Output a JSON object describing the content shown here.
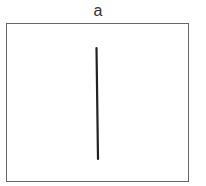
{
  "panel": {
    "label": "a",
    "frame": {
      "x": 6,
      "y": 23,
      "width": 182,
      "height": 158,
      "border_color": "#666666"
    },
    "line": {
      "x1": 96.5,
      "y1": 48,
      "x2": 98,
      "y2": 159,
      "color": "#222222",
      "width": 2.2,
      "orientation": "vertical"
    }
  }
}
